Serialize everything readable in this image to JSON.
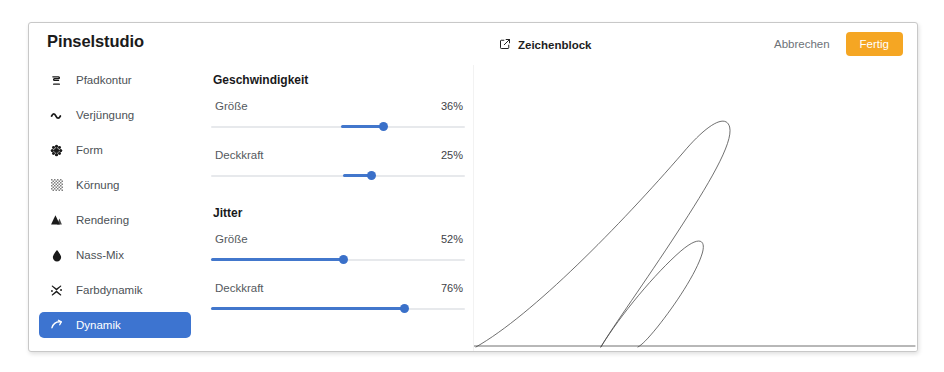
{
  "app": {
    "brand": "Pinselstudio"
  },
  "header": {
    "document_icon": "external-link-icon",
    "document_name": "Zeichenblock",
    "cancel_label": "Abbrechen",
    "confirm_label": "Fertig",
    "confirm_color": "#f5a623"
  },
  "sidebar": {
    "items": [
      {
        "label": "Pfadkontur",
        "icon": "path-contour-icon",
        "active": false
      },
      {
        "label": "Verjüngung",
        "icon": "taper-wave-icon",
        "active": false
      },
      {
        "label": "Form",
        "icon": "shape-flower-icon",
        "active": false
      },
      {
        "label": "Körnung",
        "icon": "grain-icon",
        "active": false
      },
      {
        "label": "Rendering",
        "icon": "mountains-icon",
        "active": false
      },
      {
        "label": "Nass-Mix",
        "icon": "water-drop-icon",
        "active": false
      },
      {
        "label": "Farbdynamik",
        "icon": "splatter-icon",
        "active": false
      },
      {
        "label": "Dynamik",
        "icon": "curve-arrow-icon",
        "active": true
      }
    ],
    "active_color": "#3d74d0"
  },
  "controls": {
    "accent_color": "#4277cc",
    "groups": [
      {
        "title": "Geschwindigkeit",
        "sliders": [
          {
            "label": "Größe",
            "value_text": "36%",
            "value": 36,
            "fill_start": 51,
            "fill_end": 68
          },
          {
            "label": "Deckkraft",
            "value_text": "25%",
            "value": 25,
            "fill_start": 52,
            "fill_end": 63
          }
        ]
      },
      {
        "title": "Jitter",
        "sliders": [
          {
            "label": "Größe",
            "value_text": "52%",
            "value": 52,
            "fill_start": 0,
            "fill_end": 52
          },
          {
            "label": "Deckkraft",
            "value_text": "76%",
            "value": 76,
            "fill_start": 0,
            "fill_end": 76
          }
        ]
      }
    ]
  },
  "canvas": {
    "name": "drawing-canvas",
    "stroke_color": "#4a4a4a"
  }
}
